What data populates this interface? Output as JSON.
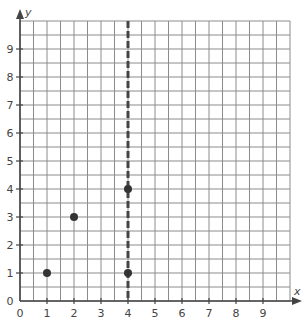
{
  "chart_data": {
    "type": "scatter",
    "title": "",
    "xlabel": "x",
    "ylabel": "y",
    "xlim": [
      0,
      10
    ],
    "ylim": [
      0,
      10
    ],
    "grid": true,
    "grid_step": 0.5,
    "x_ticks": [
      "0",
      "1",
      "2",
      "3",
      "4",
      "5",
      "6",
      "7",
      "8",
      "9"
    ],
    "y_ticks": [
      "0",
      "1",
      "2",
      "3",
      "4",
      "5",
      "6",
      "7",
      "8",
      "9"
    ],
    "points": [
      {
        "x": 1,
        "y": 1
      },
      {
        "x": 2,
        "y": 3
      },
      {
        "x": 4,
        "y": 1
      },
      {
        "x": 4,
        "y": 4
      }
    ],
    "annotations": [
      {
        "type": "dashed_vertical_line",
        "x": 4
      }
    ],
    "colors": {
      "grid": "#8c8c8c",
      "axis": "#444444",
      "point": "#333333",
      "dashed_line": "#444444"
    }
  }
}
